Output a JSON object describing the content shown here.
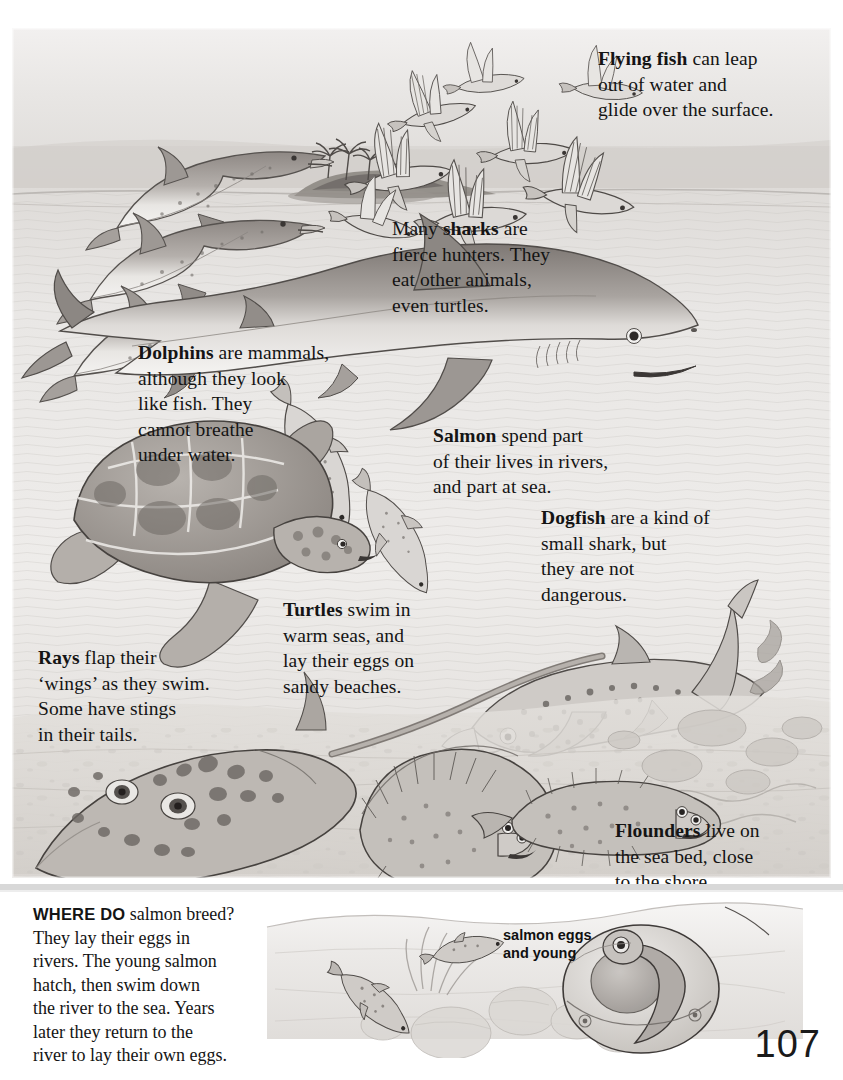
{
  "page": {
    "number": "107",
    "kind": "illustrated-reference-page"
  },
  "captions": {
    "flying_fish": {
      "lead": "Flying fish",
      "rest": " can leap\nout of water and\nglide over the surface."
    },
    "sharks": {
      "pre": "Many ",
      "lead": "sharks",
      "rest": " are\nfierce hunters.  They\neat other animals,\neven turtles."
    },
    "dolphins": {
      "lead": "Dolphins",
      "rest": " are mammals,\nalthough they look\nlike fish.  They\ncannot breathe\nunder water."
    },
    "salmon": {
      "lead": "Salmon",
      "rest": " spend part\nof their lives in rivers,\nand part at sea."
    },
    "dogfish": {
      "lead": "Dogfish",
      "rest": " are a kind of\nsmall shark, but\nthey are not\ndangerous."
    },
    "turtles": {
      "lead": "Turtles",
      "rest": " swim in\nwarm seas, and\nlay their eggs on\nsandy beaches."
    },
    "rays": {
      "lead": "Rays",
      "rest": " flap their\n‘wings’ as they swim.\nSome have stings\nin their tails."
    },
    "flounders": {
      "lead": "Flounders",
      "rest": " live on\nthe sea bed, close\nto the shore."
    }
  },
  "bottom_panel": {
    "lead": "WHERE DO",
    "body": " salmon breed?\nThey lay their eggs in\nrivers.  The young salmon\nhatch, then swim down\nthe river to the sea. Years\nlater they return to the\nriver to lay their own eggs.",
    "egg_label": "salmon eggs\nand young"
  },
  "scene": {
    "main_animals": [
      "dolphins",
      "flying-fish",
      "shark",
      "salmon",
      "sea-turtle",
      "dogfish",
      "ray",
      "flounders",
      "island-with-palms"
    ],
    "bottom_animals": [
      "young-salmon",
      "salmon-egg-magnified",
      "river-weeds",
      "river-stones"
    ]
  },
  "colors": {
    "paper": "#ffffff",
    "ink": "#141414",
    "sky": "#e6e4e2",
    "sea_light": "#eceae8",
    "sea_mid": "#d6d3d0",
    "sea_deep": "#bdb9b6",
    "creature_light": "#cfcbc7",
    "creature_mid": "#a8a39f",
    "creature_dark": "#6f6a66",
    "outline": "#4a4644",
    "divider": "#d8d8d8"
  }
}
